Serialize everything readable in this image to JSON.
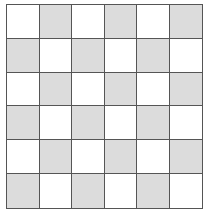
{
  "board": {
    "rows": 6,
    "cols": 6,
    "colors": {
      "light": "#ffffff",
      "shaded": "#dcdcdc",
      "line": "#555555"
    },
    "cells": [
      [
        "light",
        "shaded",
        "light",
        "shaded",
        "light",
        "shaded"
      ],
      [
        "shaded",
        "light",
        "shaded",
        "light",
        "shaded",
        "light"
      ],
      [
        "light",
        "shaded",
        "light",
        "shaded",
        "light",
        "shaded"
      ],
      [
        "shaded",
        "light",
        "shaded",
        "light",
        "shaded",
        "light"
      ],
      [
        "light",
        "shaded",
        "light",
        "shaded",
        "light",
        "shaded"
      ],
      [
        "shaded",
        "light",
        "shaded",
        "light",
        "shaded",
        "light"
      ]
    ]
  }
}
